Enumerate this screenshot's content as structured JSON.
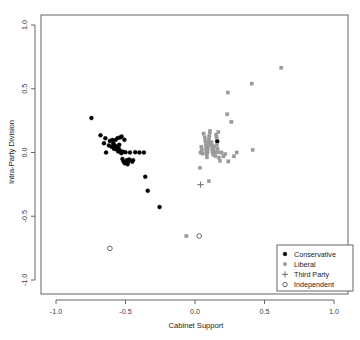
{
  "chart_data": {
    "type": "scatter",
    "title": "",
    "xlabel": "Cabinet Support",
    "ylabel": "Intra-Party Division",
    "xlim": [
      -1.0,
      1.0
    ],
    "ylim": [
      -1.0,
      1.0
    ],
    "xticks": [
      "-1.0",
      "-0.5",
      "0.0",
      "0.5",
      "1.0"
    ],
    "xtickvals": [
      -1.0,
      -0.5,
      0.0,
      0.5,
      1.0
    ],
    "yticks": [
      "-1.0",
      "-0.5",
      "0.0",
      "0.5",
      "1.0"
    ],
    "ytickvals": [
      -1.0,
      -0.5,
      0.0,
      0.5,
      1.0
    ],
    "grid": false,
    "legend_position": "bottom-right",
    "series": [
      {
        "name": "Conservative",
        "marker": "filled-circle",
        "color": "#000000",
        "points": [
          [
            -0.745,
            0.27
          ],
          [
            -0.68,
            0.135
          ],
          [
            -0.655,
            0.072
          ],
          [
            -0.645,
            0.112
          ],
          [
            -0.64,
            0.0
          ],
          [
            -0.62,
            0.055
          ],
          [
            -0.612,
            0.09
          ],
          [
            -0.6,
            0.045
          ],
          [
            -0.595,
            0.098
          ],
          [
            -0.588,
            0.07
          ],
          [
            -0.583,
            0.03
          ],
          [
            -0.578,
            0.055
          ],
          [
            -0.572,
            0.098
          ],
          [
            -0.568,
            0.025
          ],
          [
            -0.562,
            0.045
          ],
          [
            -0.558,
            0.112
          ],
          [
            -0.552,
            0.008
          ],
          [
            -0.548,
            0.03
          ],
          [
            -0.545,
            0.06
          ],
          [
            -0.54,
            0.118
          ],
          [
            -0.534,
            0.01
          ],
          [
            -0.53,
            -0.005
          ],
          [
            -0.528,
            0.125
          ],
          [
            -0.522,
            -0.05
          ],
          [
            -0.518,
            0.005
          ],
          [
            -0.514,
            -0.07
          ],
          [
            -0.508,
            0.1
          ],
          [
            -0.505,
            -0.085
          ],
          [
            -0.5,
            0.002
          ],
          [
            -0.495,
            -0.078
          ],
          [
            -0.49,
            -0.06
          ],
          [
            -0.485,
            -0.092
          ],
          [
            -0.48,
            -0.07
          ],
          [
            -0.474,
            -0.055
          ],
          [
            -0.468,
            0.0
          ],
          [
            -0.452,
            -0.072
          ],
          [
            -0.446,
            -0.06
          ],
          [
            -0.43,
            0.002
          ],
          [
            -0.4,
            0.0
          ],
          [
            -0.368,
            0.0
          ],
          [
            -0.358,
            -0.19
          ],
          [
            -0.34,
            -0.3
          ],
          [
            -0.255,
            -0.428
          ],
          [
            0.16,
            0.088
          ]
        ]
      },
      {
        "name": "Liberal",
        "marker": "filled-square",
        "color": "#999999",
        "points": [
          [
            0.062,
            0.148
          ],
          [
            0.07,
            0.118
          ],
          [
            0.074,
            0.09
          ],
          [
            0.078,
            0.062
          ],
          [
            0.08,
            0.035
          ],
          [
            0.082,
            0.008
          ],
          [
            0.084,
            -0.015
          ],
          [
            0.086,
            -0.038
          ],
          [
            0.09,
            0.0
          ],
          [
            0.092,
            0.025
          ],
          [
            0.095,
            0.052
          ],
          [
            0.098,
            0.078
          ],
          [
            0.1,
            0.102
          ],
          [
            0.103,
            0.128
          ],
          [
            0.106,
            0.155
          ],
          [
            0.108,
            0.17
          ],
          [
            0.046,
            0.045
          ],
          [
            0.05,
            0.02
          ],
          [
            0.054,
            -0.008
          ],
          [
            0.04,
            0.0
          ],
          [
            0.118,
            0.082
          ],
          [
            0.12,
            0.058
          ],
          [
            0.124,
            0.032
          ],
          [
            0.126,
            0.004
          ],
          [
            0.13,
            -0.015
          ],
          [
            0.134,
            0.02
          ],
          [
            0.138,
            0.048
          ],
          [
            0.142,
            0.0
          ],
          [
            0.146,
            -0.028
          ],
          [
            0.152,
            0.14
          ],
          [
            0.155,
            0.118
          ],
          [
            0.158,
            0.06
          ],
          [
            0.162,
            0.03
          ],
          [
            0.165,
            0.002
          ],
          [
            0.168,
            0.16
          ],
          [
            0.172,
            -0.04
          ],
          [
            0.18,
            -0.065
          ],
          [
            0.19,
            0.0
          ],
          [
            0.205,
            -0.03
          ],
          [
            0.218,
            -0.012
          ],
          [
            0.232,
            0.3
          ],
          [
            0.236,
            0.47
          ],
          [
            0.24,
            -0.07
          ],
          [
            0.262,
            0.24
          ],
          [
            0.28,
            -0.03
          ],
          [
            0.3,
            0.0
          ],
          [
            0.408,
            0.54
          ],
          [
            0.415,
            0.02
          ],
          [
            0.62,
            0.665
          ],
          [
            0.1,
            -0.225
          ],
          [
            0.036,
            -0.12
          ],
          [
            -0.062,
            -0.655
          ]
        ]
      },
      {
        "name": "Third Party",
        "marker": "plus",
        "color": "#777777",
        "points": [
          [
            0.04,
            -0.252
          ]
        ]
      },
      {
        "name": "Independent",
        "marker": "open-circle",
        "color": "#555555",
        "points": [
          [
            -0.612,
            -0.752
          ],
          [
            0.03,
            -0.655
          ]
        ]
      }
    ]
  },
  "legend": {
    "entries": [
      {
        "label": "Conservative",
        "marker": "filled-circle",
        "color": "#000000"
      },
      {
        "label": "Liberal",
        "marker": "filled-square",
        "color": "#999999"
      },
      {
        "label": "Third Party",
        "marker": "plus",
        "color": "#777777"
      },
      {
        "label": "Independent",
        "marker": "open-circle",
        "color": "#555555"
      }
    ]
  }
}
